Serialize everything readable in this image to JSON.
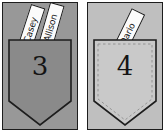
{
  "scene": {
    "title": "Name strips in numbered pockets",
    "background_color": "#ffffff"
  },
  "cards": [
    {
      "id": "card-3",
      "background_color": "#989898",
      "border_color": "#1d1d1d",
      "pocket": {
        "number": "3",
        "fill_color": "#8a8a8a",
        "outline_color": "#1d1d1d",
        "inner_dashed_border": false
      },
      "strips": [
        {
          "name": "Casey",
          "paper_color": "#fbfbfb",
          "text_color": "#121212"
        },
        {
          "name": "Allison",
          "paper_color": "#fbfbfb",
          "text_color": "#121212"
        }
      ]
    },
    {
      "id": "card-4",
      "background_color": "#bfbfbf",
      "border_color": "#1d1d1d",
      "pocket": {
        "number": "4",
        "fill_color": "#c9c9c9",
        "outline_color": "#1d1d1d",
        "inner_dashed_border": true
      },
      "strips": [
        {
          "name": "Dario",
          "paper_color": "#fbfbfb",
          "text_color": "#121212"
        }
      ]
    }
  ]
}
